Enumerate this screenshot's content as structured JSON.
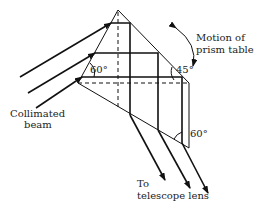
{
  "diagram": {
    "type": "prism-optics",
    "labels": {
      "collimated_line1": "Collimated",
      "collimated_line2": "beam",
      "motion_line1": "Motion of",
      "motion_line2": "prism table",
      "telescope_line1": "To",
      "telescope_line2": "telescope lens"
    },
    "angles": {
      "left": "60°",
      "right": "45°",
      "bottom": "60°"
    },
    "colors": {
      "stroke": "#111111",
      "background": "#ffffff"
    }
  }
}
